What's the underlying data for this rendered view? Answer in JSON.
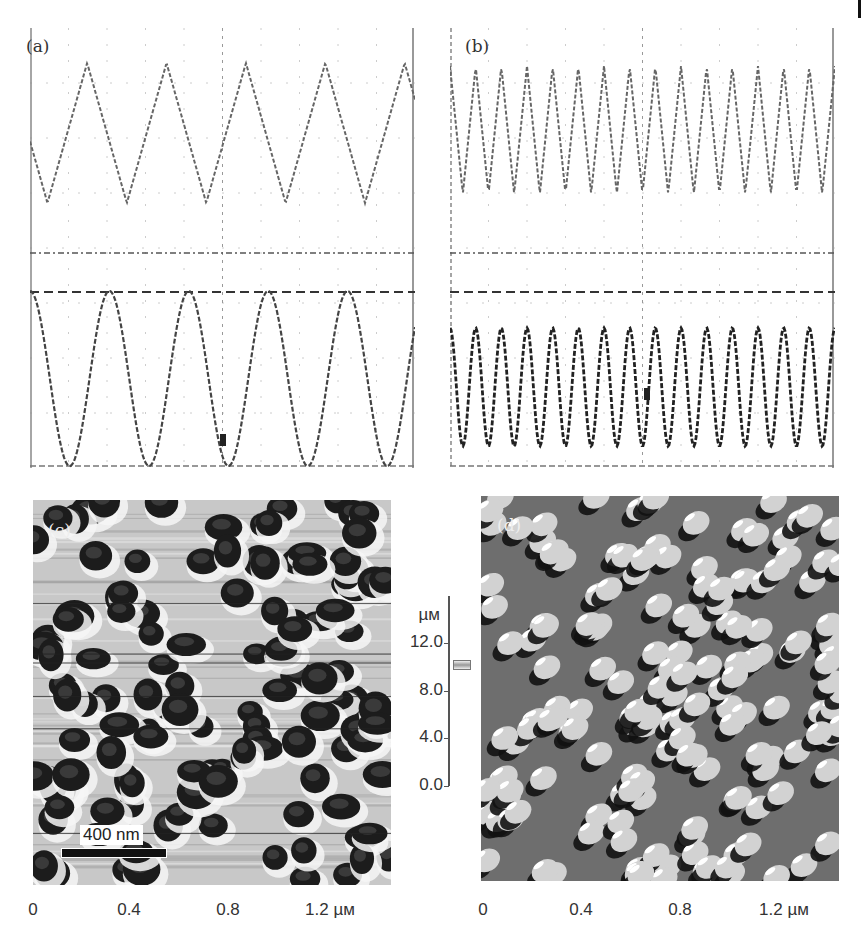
{
  "figure": {
    "panels": [
      {
        "id": "a",
        "label": "(a)",
        "type": "oscilloscope",
        "top_trace": "triangular wave, ~5 periods",
        "bottom_trace": "sinusoidal wave, ~5 periods"
      },
      {
        "id": "b",
        "label": "(b)",
        "type": "oscilloscope",
        "top_trace": "triangular wave, ~15 periods",
        "bottom_trace": "sinusoidal wave, ~15 periods"
      },
      {
        "id": "c",
        "label": "(c)",
        "type": "afm-image",
        "scale_bar": "400 nm"
      },
      {
        "id": "d",
        "label": "(d)",
        "type": "afm-image"
      }
    ],
    "colorbar": {
      "unit": "µм",
      "ticks": [
        "12.0",
        "8.0",
        "4.0",
        "0.0"
      ]
    },
    "x_axis_c": {
      "ticks": [
        "0",
        "0.4",
        "0.8",
        "1.2 µм"
      ]
    },
    "x_axis_d": {
      "ticks": [
        "0",
        "0.4",
        "0.8",
        "1.2 µм"
      ]
    }
  },
  "chart_data": [
    {
      "type": "line",
      "title": "(a)",
      "series": [
        {
          "name": "triangular drive",
          "periods": 5,
          "shape": "triangle"
        },
        {
          "name": "sinusoidal response",
          "periods": 5,
          "shape": "sine"
        }
      ],
      "grid": true
    },
    {
      "type": "line",
      "title": "(b)",
      "series": [
        {
          "name": "triangular drive",
          "periods": 15,
          "shape": "triangle"
        },
        {
          "name": "sinusoidal response",
          "periods": 15,
          "shape": "sine"
        }
      ],
      "grid": true
    },
    {
      "type": "heatmap",
      "title": "(c)",
      "xlabel": "µм",
      "x_ticks": [
        0,
        0.4,
        0.8,
        1.2
      ],
      "colorbar_ticks": [
        0.0,
        4.0,
        8.0,
        12.0
      ],
      "colorbar_unit": "µм",
      "annotation": "400 nm"
    },
    {
      "type": "heatmap",
      "title": "(d)",
      "xlabel": "µм",
      "x_ticks": [
        0,
        0.4,
        0.8,
        1.2
      ]
    }
  ]
}
